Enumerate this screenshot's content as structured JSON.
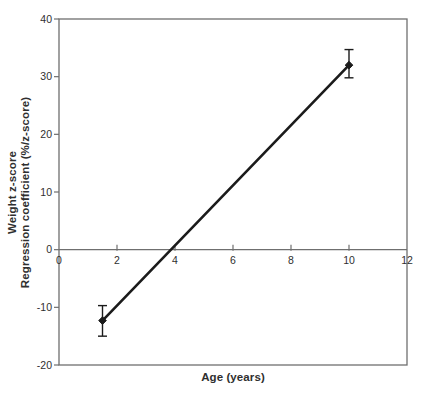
{
  "figure": {
    "background_color": "#ffffff",
    "axis_color": "#6f6f6f",
    "text_color": "#2f2f2f",
    "series_color": "#1b1b1b"
  },
  "chart_data": {
    "type": "line",
    "title": "",
    "xlabel": "Age (years)",
    "ylabel_line1": "Weight z-score",
    "ylabel_line2": "Regression coefficient (%/z-score)",
    "xlim": [
      0,
      12
    ],
    "ylim": [
      -20,
      40
    ],
    "x_ticks": [
      0,
      2,
      4,
      6,
      8,
      10,
      12
    ],
    "y_ticks": [
      40,
      30,
      20,
      10,
      0,
      -10,
      -20
    ],
    "grid": false,
    "zero_line": true,
    "legend": null,
    "series": [
      {
        "name": "weight-zscore-regression-coefficient",
        "marker": "diamond",
        "points": [
          {
            "x": 1.5,
            "y": -12.3,
            "err_low": -15.0,
            "err_high": -9.7
          },
          {
            "x": 10,
            "y": 32.0,
            "err_low": 29.8,
            "err_high": 34.7
          }
        ]
      }
    ]
  }
}
